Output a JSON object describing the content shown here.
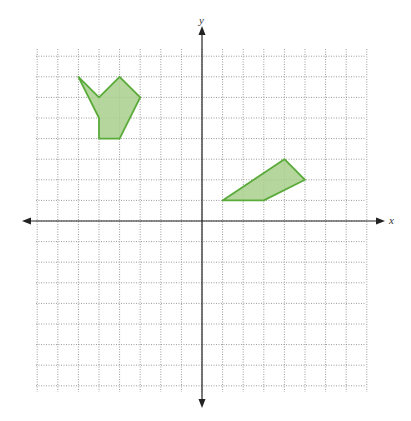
{
  "chart_data": {
    "type": "coordinate-plane",
    "title": "",
    "xlabel": "x",
    "ylabel": "y",
    "xlim": [
      -8,
      8
    ],
    "ylim": [
      -8,
      8
    ],
    "grid": true,
    "grid_style": "dotted",
    "shapes": [
      {
        "name": "shape-a",
        "vertices": [
          [
            -6,
            7
          ],
          [
            -5,
            6
          ],
          [
            -4,
            7
          ],
          [
            -3,
            6
          ],
          [
            -4,
            4
          ],
          [
            -5,
            4
          ],
          [
            -5,
            5
          ]
        ],
        "fill": "#a8d08d",
        "stroke": "#5aab3a"
      },
      {
        "name": "shape-b",
        "vertices": [
          [
            1,
            1
          ],
          [
            4,
            3
          ],
          [
            5,
            2
          ],
          [
            3,
            1
          ]
        ],
        "fill": "#a8d08d",
        "stroke": "#5aab3a"
      }
    ]
  },
  "layout": {
    "origin_px": [
      202,
      221
    ],
    "cell_px": 20.6,
    "grid_px": {
      "left": 36,
      "right": 365,
      "top": 49,
      "bottom": 392
    },
    "xaxis_px": {
      "from": 22,
      "to": 385
    },
    "yaxis_px": {
      "from": 26,
      "to": 408
    }
  },
  "colors": {
    "grid": "#9a9a9a",
    "axis": "#222222",
    "shape_fill": "#a8d08d",
    "shape_stroke": "#5aab3a"
  }
}
